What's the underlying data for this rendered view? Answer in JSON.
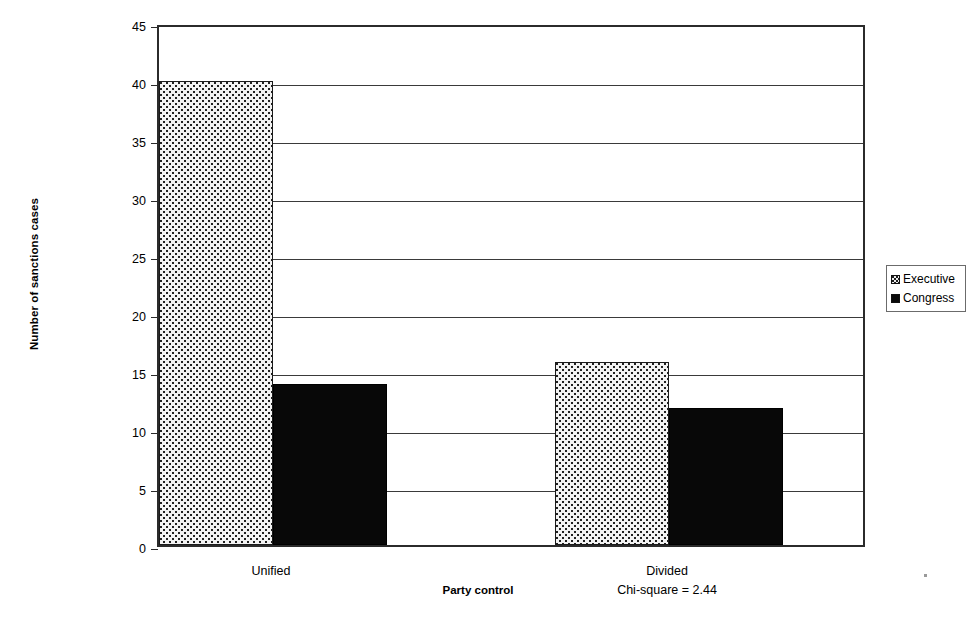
{
  "chart_data": {
    "type": "bar",
    "title": "",
    "xlabel": "Party control",
    "ylabel": "Number of sanctions cases",
    "categories": [
      "Unified",
      "Divided"
    ],
    "series": [
      {
        "name": "Executive",
        "values": [
          40,
          15.8
        ],
        "fill": "stippled-light-gray",
        "color": "#f2f2f2"
      },
      {
        "name": "Congress",
        "values": [
          13.9,
          11.8
        ],
        "fill": "solid-black",
        "color": "#080808"
      }
    ],
    "ylim": [
      0,
      45
    ],
    "yticks": [
      0,
      5,
      10,
      15,
      20,
      25,
      30,
      35,
      40,
      45
    ],
    "ytick_labels": [
      "0",
      "5",
      "10",
      "15",
      "20",
      "25",
      "30",
      "35",
      "40",
      "45"
    ],
    "grid": "horizontal",
    "legend_position": "right",
    "annotations": [
      {
        "text": "Chi-square = 2.44",
        "attached_to": "Divided",
        "position": "below-category-label"
      }
    ]
  },
  "axes": {
    "y_title": "Number of sanctions cases",
    "x_title": "Party control"
  },
  "legend": {
    "entries": [
      {
        "label": "Executive",
        "swatch": "stipple-swatch"
      },
      {
        "label": "Congress",
        "swatch": "black-swatch"
      }
    ]
  },
  "categories": [
    {
      "label": "Unified",
      "sub": ""
    },
    {
      "label": "Divided",
      "sub": "Chi-square = 2.44"
    }
  ]
}
